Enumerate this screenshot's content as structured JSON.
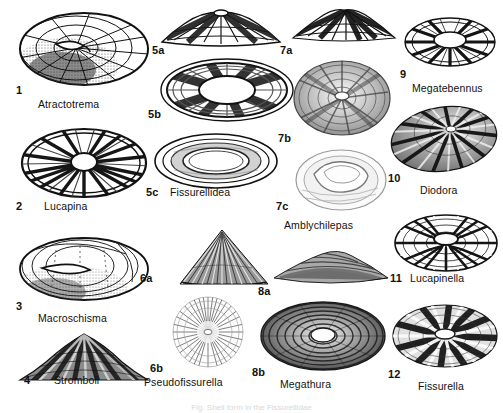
{
  "plate": {
    "title": "Fissurellidae shell plate",
    "background_color": "#ffffff",
    "ink_color": "#1a1a1a",
    "bottom_caption": "Fig. Shell form in the Fissurellidae"
  },
  "figures": [
    {
      "num": "1",
      "genus": "Atractotrema",
      "view": "apical",
      "shape": "oval-depressed",
      "aperture": "elongate-teardrop keyhole, anterior",
      "sculpture": "fine radial and concentric reticulation",
      "shade": "light"
    },
    {
      "num": "2",
      "genus": "Lucapina",
      "view": "apical",
      "shape": "oval",
      "aperture": "round central foramen",
      "sculpture": "strong alternating dark radial rays",
      "shade": "dark"
    },
    {
      "num": "3",
      "genus": "Macroschisma",
      "view": "apical",
      "shape": "elongate-oval, low",
      "aperture": "very long narrow slit",
      "sculpture": "faint concentric growth lines, stippled",
      "shade": "light"
    },
    {
      "num": "4",
      "genus": "Stromboli",
      "view": "lateral profile",
      "shape": "low broad cone",
      "aperture": "not visible in profile",
      "sculpture": "irregular mottled radial bands",
      "shade": "dark"
    },
    {
      "num": "5a",
      "genus": "",
      "view": "lateral profile",
      "shape": "low saddle-shaped cone",
      "aperture": "apical notch at summit",
      "sculpture": "broad dark radial blotches",
      "shade": "medium"
    },
    {
      "num": "5b",
      "genus": "",
      "view": "apical",
      "shape": "broad oval",
      "aperture": "large elongate oval foramen",
      "sculpture": "bold dark radial blocks around foramen",
      "shade": "dark"
    },
    {
      "num": "5c",
      "genus": "Fissurellidea",
      "view": "basal / interior",
      "shape": "oval",
      "aperture": "large oval opening with inner rim",
      "sculpture": "smooth concentric ledges",
      "shade": "light"
    },
    {
      "num": "6a",
      "genus": "",
      "view": "lateral profile",
      "shape": "tall triangular cone",
      "aperture": "apical notch",
      "sculpture": "fine dense radial ribs",
      "shade": "medium"
    },
    {
      "num": "6b",
      "genus": "Pseudofissurella",
      "view": "apical",
      "shape": "circular",
      "aperture": "small central foramen",
      "sculpture": "very fine dense radial striae",
      "shade": "light"
    },
    {
      "num": "7a",
      "genus": "",
      "view": "lateral profile",
      "shape": "low arched cone",
      "aperture": "apical slit",
      "sculpture": "coarse dark radial bands",
      "shade": "dark"
    },
    {
      "num": "7b",
      "genus": "",
      "view": "apical",
      "shape": "circular",
      "aperture": "small elongate central foramen",
      "sculpture": "concentric growth rings with radial shading",
      "shade": "medium"
    },
    {
      "num": "7c",
      "genus": "Amblychilepas",
      "view": "basal / interior",
      "shape": "rounded oval",
      "aperture": "broad irregular internal callus",
      "sculpture": "smooth, faint",
      "shade": "light"
    },
    {
      "num": "8a",
      "genus": "",
      "view": "lateral profile",
      "shape": "very low flattened cone",
      "aperture": "apical slit",
      "sculpture": "fine concentric lines",
      "shade": "medium"
    },
    {
      "num": "8b",
      "genus": "Megathura",
      "view": "apical",
      "shape": "broad oval, flattened",
      "aperture": "very large elongate foramen",
      "sculpture": "dense concentric rings",
      "shade": "dark"
    },
    {
      "num": "9",
      "genus": "Megatebennus",
      "view": "apical",
      "shape": "oval",
      "aperture": "large elongate foramen",
      "sculpture": "coarse dark radial ribs",
      "shade": "dark"
    },
    {
      "num": "10",
      "genus": "Diodora",
      "view": "apical",
      "shape": "oval, elevated",
      "aperture": "small subcentral foramen",
      "sculpture": "strong alternating radial ribs",
      "shade": "dark"
    },
    {
      "num": "11",
      "genus": "Lucapinella",
      "view": "apical",
      "shape": "oval, depressed",
      "aperture": "elongate central foramen",
      "sculpture": "coarse radiating ribs, latticed",
      "shade": "dark"
    },
    {
      "num": "12",
      "genus": "Fissurella",
      "view": "apical",
      "shape": "oval",
      "aperture": "elongate central foramen",
      "sculpture": "broad dark radial rays",
      "shade": "dark"
    }
  ]
}
